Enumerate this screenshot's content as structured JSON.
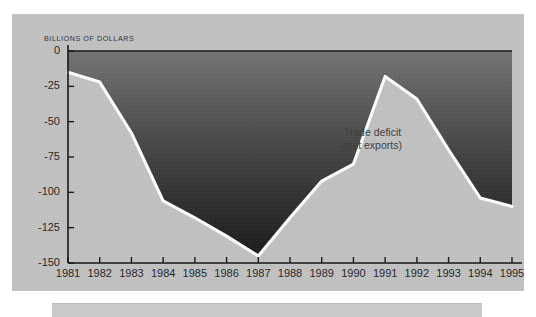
{
  "figure": {
    "axis_unit_label": "BILLIONS OF DOLLARS",
    "annotation_line1": "Trade deficit",
    "annotation_line2": "(net exports)",
    "panel_background": "#c2c2c2",
    "line_color": "#ffffff",
    "fill_top_color": "#6e6e6e",
    "fill_bottom_color": "#161616",
    "axis_color": "#111111",
    "caption_bar_color": "#c9c9c9"
  },
  "chart_data": {
    "type": "area",
    "title": "",
    "subtitle": "",
    "xlabel": "",
    "ylabel": "BILLIONS OF DOLLARS",
    "categories": [
      "1981",
      "1982",
      "1983",
      "1984",
      "1985",
      "1986",
      "1987",
      "1988",
      "1989",
      "1990",
      "1991",
      "1992",
      "1993",
      "1994",
      "1995"
    ],
    "series": [
      {
        "name": "Trade deficit (net exports)",
        "values": [
          -15,
          -22,
          -58,
          -106,
          -118,
          -131,
          -145,
          -118,
          -92,
          -80,
          -18,
          -34,
          -70,
          -104,
          -110
        ]
      }
    ],
    "x": [
      1981,
      1982,
      1983,
      1984,
      1985,
      1986,
      1987,
      1988,
      1989,
      1990,
      1991,
      1992,
      1993,
      1994,
      1995
    ],
    "ylim": [
      -150,
      0
    ],
    "xlim": [
      1981,
      1995
    ],
    "yticks": [
      0,
      -25,
      -50,
      -75,
      -100,
      -125,
      -150
    ],
    "ytick_labels": [
      "0",
      "-25",
      "-50",
      "-75",
      "-100",
      "-125",
      "-150"
    ],
    "xticks": [
      1981,
      1982,
      1983,
      1984,
      1985,
      1986,
      1987,
      1988,
      1989,
      1990,
      1991,
      1992,
      1993,
      1994,
      1995
    ],
    "grid": false,
    "legend": "none",
    "annotations": [
      {
        "text": "Trade deficit (net exports)",
        "x": 1990.6,
        "y": -62
      }
    ]
  }
}
